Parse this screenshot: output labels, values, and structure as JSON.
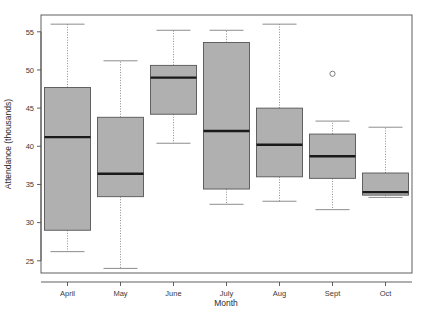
{
  "chart_data": {
    "type": "box",
    "title": "",
    "xlabel": "Month",
    "ylabel": "Attendance (thousands)",
    "categories": [
      "April",
      "May",
      "June",
      "July",
      "Aug",
      "Sept",
      "Oct"
    ],
    "ylim": [
      23.4,
      57.2
    ],
    "yticks": [
      25,
      30,
      35,
      40,
      45,
      50,
      55
    ],
    "ytick_labels": [
      "25",
      "30",
      "35",
      "40",
      "45",
      "50",
      "55"
    ],
    "grid": false,
    "legend": null,
    "box_fill_color": "#b0b0b0",
    "box_border_color": "#555555",
    "median_color": "#1a1a1a",
    "whisker_color": "#808080",
    "boxes": [
      {
        "category": "April",
        "whisker_low": 26.2,
        "q1": 29.0,
        "median": 41.2,
        "q3": 47.7,
        "whisker_high": 56.0,
        "outliers": []
      },
      {
        "category": "May",
        "whisker_low": 24.0,
        "q1": 33.4,
        "median": 36.4,
        "q3": 43.8,
        "whisker_high": 51.2,
        "outliers": []
      },
      {
        "category": "June",
        "whisker_low": 40.4,
        "q1": 44.2,
        "median": 49.0,
        "q3": 50.6,
        "whisker_high": 55.2,
        "outliers": []
      },
      {
        "category": "July",
        "whisker_low": 32.4,
        "q1": 34.4,
        "median": 42.0,
        "q3": 53.6,
        "whisker_high": 55.2,
        "outliers": []
      },
      {
        "category": "Aug",
        "whisker_low": 32.8,
        "q1": 36.0,
        "median": 40.2,
        "q3": 45.0,
        "whisker_high": 56.0,
        "outliers": []
      },
      {
        "category": "Sept",
        "whisker_low": 31.7,
        "q1": 35.8,
        "median": 38.7,
        "q3": 41.6,
        "whisker_high": 43.3,
        "outliers": [
          49.5
        ]
      },
      {
        "category": "Oct",
        "whisker_low": 33.3,
        "q1": 33.6,
        "median": 34.0,
        "q3": 36.5,
        "whisker_high": 42.5,
        "outliers": []
      }
    ]
  }
}
